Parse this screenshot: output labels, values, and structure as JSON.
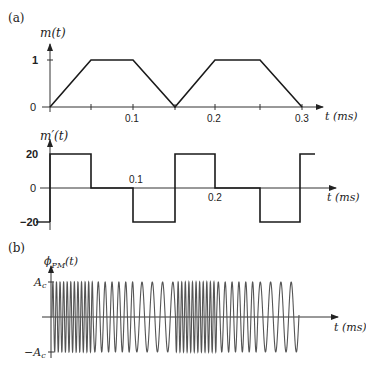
{
  "figure": {
    "panel_a_label": "(a)",
    "panel_b_label": "(b)"
  },
  "plot1": {
    "ylabel": "m(t)",
    "xlabel": "t (ms)",
    "yticks": [
      "1",
      "0"
    ],
    "xticks": [
      "0.1",
      "0.2",
      "0.3"
    ],
    "waveform": "trapezoidal",
    "points_t_ms": [
      0,
      0.05,
      0.1,
      0.15,
      0.2,
      0.25,
      0.3
    ],
    "points_value": [
      0,
      1,
      1,
      0,
      1,
      1,
      0
    ]
  },
  "plot2": {
    "ylabel": "m′(t)",
    "xlabel": "t (ms)",
    "yticks": [
      "20",
      "0",
      "−20"
    ],
    "xticks": [
      "0.1",
      "0.2"
    ],
    "waveform": "piecewise-constant derivative",
    "segments": [
      {
        "t0": 0,
        "t1": 0.05,
        "value": 20
      },
      {
        "t0": 0.05,
        "t1": 0.1,
        "value": 0
      },
      {
        "t0": 0.1,
        "t1": 0.15,
        "value": -20
      },
      {
        "t0": 0.15,
        "t1": 0.2,
        "value": 20
      },
      {
        "t0": 0.2,
        "t1": 0.25,
        "value": 0
      },
      {
        "t0": 0.25,
        "t1": 0.3,
        "value": -20
      },
      {
        "t0": 0.3,
        "t1": 0.32,
        "value": 20
      }
    ]
  },
  "plot3": {
    "ylabel": "ϕ",
    "ylabel_sub": "PM",
    "ylabel_suffix": "(t)",
    "xlabel": "t (ms)",
    "yticks": [
      "A",
      "−A"
    ],
    "ytick_sub": "c",
    "waveform": "phase-modulated carrier",
    "segments": [
      {
        "t0": 0,
        "t1": 0.05,
        "frequency": "high"
      },
      {
        "t0": 0.05,
        "t1": 0.1,
        "frequency": "carrier"
      },
      {
        "t0": 0.1,
        "t1": 0.15,
        "frequency": "low"
      },
      {
        "t0": 0.15,
        "t1": 0.2,
        "frequency": "high"
      },
      {
        "t0": 0.2,
        "t1": 0.25,
        "frequency": "carrier"
      },
      {
        "t0": 0.25,
        "t1": 0.3,
        "frequency": "low"
      }
    ]
  },
  "colors": {
    "line": "#1a1a1a",
    "axis": "#333333",
    "signal": "#555555"
  }
}
